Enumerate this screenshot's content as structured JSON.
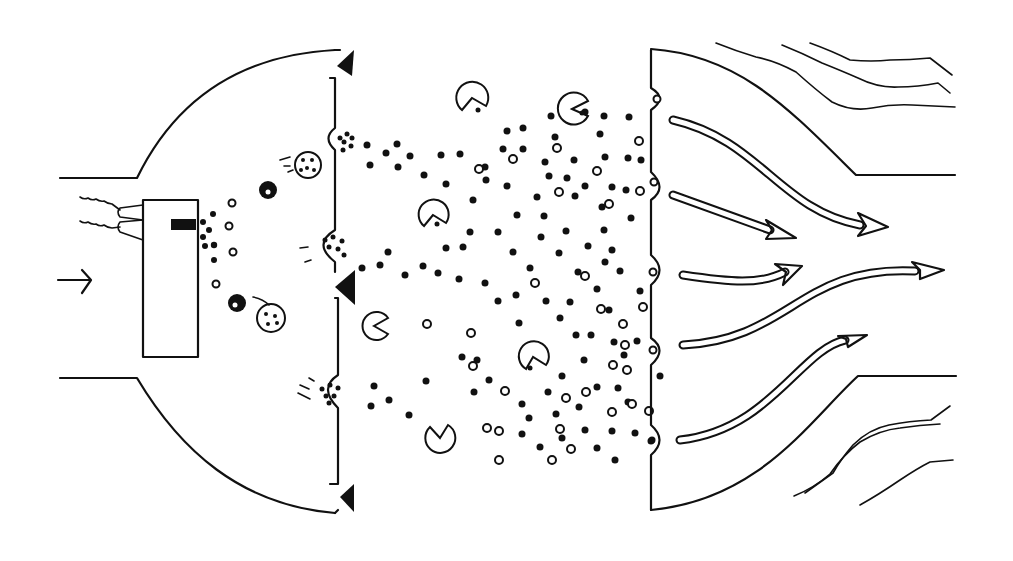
{
  "diagram": {
    "title": "",
    "colors": {
      "ink": "#111111",
      "background": "#ffffff"
    },
    "inlet_arrow": {
      "from": [
        58,
        280
      ],
      "to": [
        92,
        280
      ]
    },
    "injector_box": {
      "x": 143,
      "y": 200,
      "w": 55,
      "h": 157
    },
    "triangle_markers": [
      {
        "cx": 346,
        "cy": 65,
        "dir": "left"
      },
      {
        "cx": 346,
        "cy": 287,
        "dir": "left"
      },
      {
        "cx": 348,
        "cy": 497,
        "dir": "left"
      }
    ],
    "pacmen": [
      {
        "cx": 472,
        "cy": 98,
        "r": 16,
        "mouth": "down"
      },
      {
        "cx": 572,
        "cy": 109,
        "r": 16,
        "mouth": "right"
      },
      {
        "cx": 433,
        "cy": 215,
        "r": 15,
        "mouth": "down"
      },
      {
        "cx": 374,
        "cy": 326,
        "r": 14,
        "mouth": "right"
      },
      {
        "cx": 533,
        "cy": 357,
        "r": 15,
        "mouth": "down"
      },
      {
        "cx": 440,
        "cy": 438,
        "r": 15,
        "mouth": "up-right"
      }
    ],
    "cells": [
      {
        "cx": 308,
        "cy": 165,
        "r": 13,
        "type": "open"
      },
      {
        "cx": 268,
        "cy": 190,
        "r": 9,
        "type": "filled"
      },
      {
        "cx": 237,
        "cy": 303,
        "r": 9,
        "type": "filled"
      },
      {
        "cx": 271,
        "cy": 318,
        "r": 14,
        "type": "open"
      }
    ],
    "flow_arrows": [
      {
        "label": "upper-long"
      },
      {
        "label": "upper-short"
      },
      {
        "label": "middle-short"
      },
      {
        "label": "middle-long"
      },
      {
        "label": "lower"
      }
    ]
  }
}
